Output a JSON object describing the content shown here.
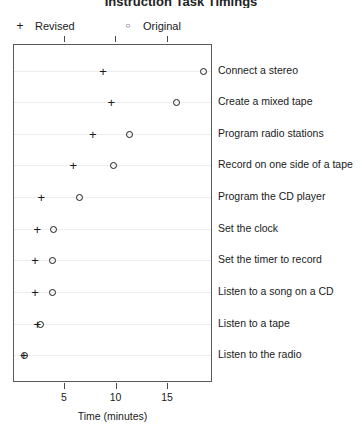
{
  "title_remnant": "Instruction Task Timings",
  "legend": {
    "items": [
      {
        "marker": "plus-marker",
        "glyph": "+",
        "label": "Revised"
      },
      {
        "marker": "circle-marker",
        "glyph": "○",
        "label": "Original"
      }
    ]
  },
  "axis": {
    "xlabel": "Time (minutes)",
    "tick_labels": [
      "5",
      "10",
      "15"
    ],
    "tick_values": [
      5,
      10,
      15
    ]
  },
  "chart_data": {
    "type": "scatter",
    "title": "Instruction Task Timings",
    "xlabel": "Time (minutes)",
    "ylabel": "",
    "xlim": [
      0.05,
      19.4
    ],
    "grid": true,
    "legend_position": "top",
    "orientation": "horizontal-dotplot",
    "categories": [
      "Connect a stereo",
      "Create a mixed tape",
      "Program radio stations",
      "Record on one side of a tape",
      "Program the CD player",
      "Set the clock",
      "Set the timer to record",
      "Listen to a song on a CD",
      "Listen to a tape",
      "Listen to the radio"
    ],
    "series": [
      {
        "name": "Revised",
        "marker": "+",
        "values": [
          8.7,
          9.5,
          7.7,
          5.8,
          2.7,
          2.3,
          2.1,
          2.1,
          2.3,
          1.0
        ]
      },
      {
        "name": "Original",
        "marker": "○",
        "values": [
          18.4,
          15.8,
          11.3,
          9.7,
          6.4,
          3.9,
          3.8,
          3.8,
          2.6,
          1.1
        ]
      }
    ]
  }
}
